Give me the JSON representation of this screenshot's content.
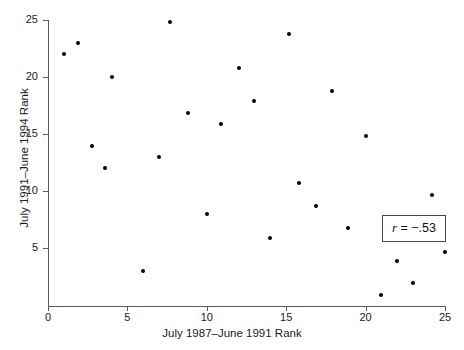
{
  "chart_data": {
    "type": "scatter",
    "title": "",
    "xlabel": "July 1987–June 1991 Rank",
    "ylabel": "July 1991–June 1994 Rank",
    "xlim": [
      0,
      25
    ],
    "ylim": [
      0,
      25
    ],
    "xticks": [
      0,
      5,
      10,
      15,
      20,
      25
    ],
    "yticks": [
      5,
      10,
      15,
      20,
      25
    ],
    "xtick_labels": [
      "0",
      "5",
      "10",
      "15",
      "20",
      "25"
    ],
    "ytick_labels": [
      "5",
      "10",
      "15",
      "20",
      "25"
    ],
    "grid": false,
    "legend": false,
    "marker": "filled-circle",
    "marker_color": "#000000",
    "points": [
      {
        "x": 1.0,
        "y": 22.0
      },
      {
        "x": 1.9,
        "y": 23.0
      },
      {
        "x": 2.8,
        "y": 14.0
      },
      {
        "x": 3.6,
        "y": 12.0
      },
      {
        "x": 4.0,
        "y": 20.0
      },
      {
        "x": 6.0,
        "y": 3.0
      },
      {
        "x": 7.0,
        "y": 13.0
      },
      {
        "x": 7.7,
        "y": 24.8
      },
      {
        "x": 8.8,
        "y": 16.9
      },
      {
        "x": 10.0,
        "y": 8.0
      },
      {
        "x": 10.9,
        "y": 15.9
      },
      {
        "x": 12.0,
        "y": 20.8
      },
      {
        "x": 13.0,
        "y": 17.9
      },
      {
        "x": 14.0,
        "y": 5.9
      },
      {
        "x": 15.2,
        "y": 23.8
      },
      {
        "x": 15.8,
        "y": 10.7
      },
      {
        "x": 16.9,
        "y": 8.7
      },
      {
        "x": 17.9,
        "y": 18.8
      },
      {
        "x": 18.9,
        "y": 6.8
      },
      {
        "x": 20.0,
        "y": 14.8
      },
      {
        "x": 21.0,
        "y": 0.9
      },
      {
        "x": 22.0,
        "y": 3.9
      },
      {
        "x": 23.0,
        "y": 2.0
      },
      {
        "x": 24.2,
        "y": 9.7
      },
      {
        "x": 25.0,
        "y": 4.7
      }
    ],
    "annotations": [
      {
        "name": "correlation-box",
        "symbol": "r",
        "text": " = −.53",
        "full_text": "r = −.53",
        "value": -0.53
      }
    ]
  }
}
